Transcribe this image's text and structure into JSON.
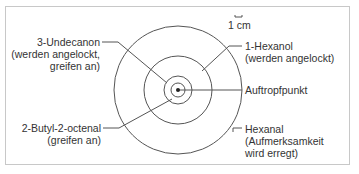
{
  "diagram": {
    "scale_label": "1 cm",
    "center_label": "Auftropfpunkt",
    "rings": [
      {
        "name": "innermost",
        "label": "3-Undecanon",
        "note": "(werden angelockt,",
        "note2": "greifen an)"
      },
      {
        "name": "small",
        "label": "2-Butyl-2-octenal",
        "note": "(greifen an)"
      },
      {
        "name": "middle",
        "label": "1-Hexanol",
        "note": "(werden angelockt)"
      },
      {
        "name": "outer",
        "label": "Hexanal",
        "note": "(Aufmerksamkeit",
        "note2": "wird erregt)"
      }
    ],
    "colors": {
      "line": "#555555",
      "text": "#333333",
      "frame": "#c8c8c8"
    }
  }
}
